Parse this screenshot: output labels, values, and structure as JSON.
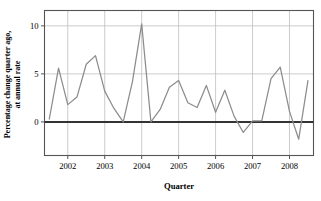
{
  "chart_data": {
    "type": "line",
    "title": "",
    "xlabel": "Quarter",
    "ylabel": "Percentage change quarter ago, at annual rate",
    "ylabel_line1": "Percentage change quarter ago,",
    "ylabel_line2": "at annual rate",
    "ylim": [
      -3.5,
      11.6
    ],
    "yticks": [
      0,
      5,
      10
    ],
    "ytick_labels": [
      "0",
      "5",
      "10"
    ],
    "xlim": [
      2001.37,
      2008.65
    ],
    "xticks": [
      2002,
      2003,
      2004,
      2005,
      2006,
      2007,
      2008
    ],
    "xtick_labels": [
      "2002",
      "2003",
      "2004",
      "2005",
      "2006",
      "2007",
      "2008"
    ],
    "grid": "vertical-at-xticks-and-horizontal-at-yticks",
    "legend": "none",
    "line_color": "#8c8c8c",
    "zero_line_color": "#333333",
    "axis_color": "#555555",
    "grid_color": "#bfbfbf",
    "x": [
      2001.5,
      2001.75,
      2002.0,
      2002.25,
      2002.5,
      2002.75,
      2003.0,
      2003.25,
      2003.5,
      2003.75,
      2004.0,
      2004.25,
      2004.5,
      2004.75,
      2005.0,
      2005.25,
      2005.5,
      2005.75,
      2006.0,
      2006.25,
      2006.5,
      2006.75,
      2007.0,
      2007.25,
      2007.5,
      2007.75,
      2008.0,
      2008.25,
      2008.5
    ],
    "categories": [
      "2001 Q2",
      "2001 Q3",
      "2001 Q4",
      "2002 Q1",
      "2002 Q2",
      "2002 Q3",
      "2002 Q4",
      "2003 Q1",
      "2003 Q2",
      "2003 Q3",
      "2003 Q4",
      "2004 Q1",
      "2004 Q2",
      "2004 Q3",
      "2004 Q4",
      "2005 Q1",
      "2005 Q2",
      "2005 Q3",
      "2005 Q4",
      "2006 Q1",
      "2006 Q2",
      "2006 Q3",
      "2006 Q4",
      "2007 Q1",
      "2007 Q2",
      "2007 Q3",
      "2007 Q4",
      "2008 Q1",
      "2008 Q2"
    ],
    "values": [
      0.3,
      5.6,
      1.8,
      2.6,
      6.0,
      6.9,
      3.2,
      1.4,
      0.0,
      4.2,
      10.2,
      0.0,
      1.3,
      3.6,
      4.3,
      2.0,
      1.5,
      3.8,
      1.0,
      3.3,
      0.6,
      -1.1,
      0.1,
      0.1,
      4.5,
      5.7,
      1.1,
      -1.8,
      4.3
    ],
    "series": [
      {
        "name": "Percentage change quarter ago, at annual rate",
        "values": [
          0.3,
          5.6,
          1.8,
          2.6,
          6.0,
          6.9,
          3.2,
          1.4,
          0.0,
          4.2,
          10.2,
          0.0,
          1.3,
          3.6,
          4.3,
          2.0,
          1.5,
          3.8,
          1.0,
          3.3,
          0.6,
          -1.1,
          0.1,
          0.1,
          4.5,
          5.7,
          1.1,
          -1.8,
          4.3
        ]
      }
    ]
  }
}
